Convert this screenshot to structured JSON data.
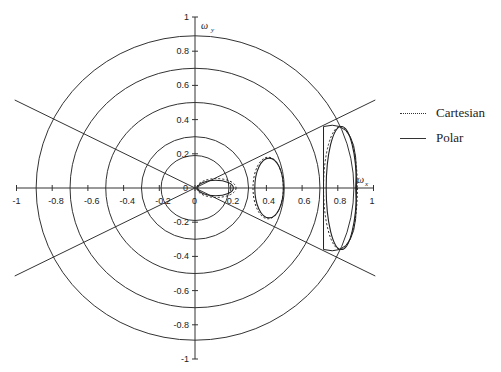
{
  "chart_data": {
    "type": "line",
    "title": "",
    "xlabel": "ω_x",
    "ylabel": "ω_y",
    "xlim": [
      -1,
      1
    ],
    "ylim": [
      -1,
      1
    ],
    "x_ticks": [
      -1,
      -0.8,
      -0.6,
      -0.4,
      -0.2,
      0,
      0.2,
      0.4,
      0.6,
      0.8,
      1
    ],
    "x_tick_labels": [
      "-1",
      "-0.8",
      "-0.6",
      "-0.4",
      "-0.2",
      "0",
      "0.2",
      "0.4",
      "0.6",
      "0.8",
      "1"
    ],
    "y_ticks": [
      -1,
      -0.8,
      -0.6,
      -0.4,
      -0.2,
      0,
      0.2,
      0.4,
      0.6,
      0.8,
      1
    ],
    "y_tick_labels": [
      "-1",
      "-0.8",
      "-0.6",
      "-0.4",
      "-0.2",
      "0",
      "0.2",
      "0.4",
      "0.6",
      "0.8",
      "1"
    ],
    "grid": false,
    "legend_position": "right",
    "legend": [
      "Cartesian",
      "Polar"
    ],
    "reference_circles_radii": [
      0.19,
      0.3,
      0.5,
      0.7,
      0.89
    ],
    "reference_lines_angle_deg": [
      27,
      -27
    ],
    "series": [
      {
        "name": "Cartesian",
        "style": "dotted",
        "lobes": [
          {
            "cx": 0.12,
            "cy": 0.0,
            "rx": 0.11,
            "ry": 0.055,
            "region": "inner"
          },
          {
            "cx": 0.41,
            "cy": 0.0,
            "rx": 0.085,
            "ry": 0.18,
            "region": "middle"
          },
          {
            "cx": 0.815,
            "cy": 0.0,
            "rx": 0.095,
            "ry": 0.36,
            "region": "outer"
          }
        ]
      },
      {
        "name": "Polar",
        "style": "solid",
        "lobes": [
          {
            "cx": 0.115,
            "cy": 0.0,
            "rx": 0.1,
            "ry": 0.045,
            "region": "inner"
          },
          {
            "cx": 0.415,
            "cy": 0.0,
            "rx": 0.08,
            "ry": 0.175,
            "region": "middle"
          },
          {
            "cx": 0.82,
            "cy": 0.0,
            "rx": 0.085,
            "ry": 0.36,
            "region": "outer"
          }
        ]
      }
    ]
  },
  "legend": {
    "items": [
      {
        "label": "Cartesian",
        "style": "dotted"
      },
      {
        "label": "Polar",
        "style": "solid"
      }
    ]
  },
  "axes": {
    "x_label": "ω",
    "x_sub": "x",
    "y_label": "ω",
    "y_sub": "y"
  }
}
